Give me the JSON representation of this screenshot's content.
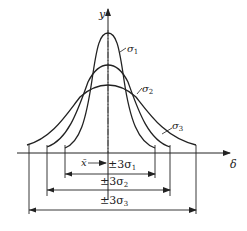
{
  "axes": {
    "y_label": "y",
    "x_label": "δ"
  },
  "curves": [
    {
      "name": "σ1",
      "label": "σ",
      "sub": "1"
    },
    {
      "name": "σ2",
      "label": "σ",
      "sub": "2"
    },
    {
      "name": "σ3",
      "label": "σ",
      "sub": "3"
    }
  ],
  "mean_label": "x̄",
  "dimensions": [
    {
      "text": "±3σ",
      "sub": "1"
    },
    {
      "text": "±3σ",
      "sub": "2"
    },
    {
      "text": "±3σ",
      "sub": "3"
    }
  ],
  "colors": {
    "stroke": "#222222",
    "background": "#ffffff"
  }
}
